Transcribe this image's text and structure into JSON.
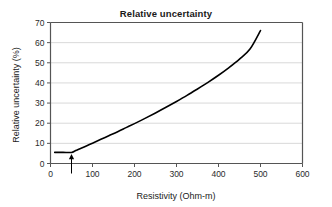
{
  "chart_data": {
    "type": "line",
    "title": "Relative uncertainty",
    "xlabel": "Resistivity (Ohm-m)",
    "ylabel": "Relative uncertainty (%)",
    "xlim": [
      0,
      600
    ],
    "ylim": [
      0,
      70
    ],
    "xticks": [
      0,
      100,
      200,
      300,
      400,
      500,
      600
    ],
    "xtick_labels": [
      "0",
      "100",
      "200",
      "300",
      "400",
      "500",
      "600"
    ],
    "yticks": [
      0,
      10,
      20,
      30,
      40,
      50,
      60,
      70
    ],
    "ytick_labels": [
      "0",
      "10",
      "20",
      "30",
      "40",
      "50",
      "60",
      "70"
    ],
    "grid": "horizontal",
    "grid_color": "#d9d9d9",
    "legend": "none",
    "line_color": "#000000",
    "line_width": 1.6,
    "series": [
      {
        "name": "Relative uncertainty",
        "x": [
          10,
          30,
          50,
          60,
          80,
          100,
          120,
          140,
          160,
          180,
          200,
          225,
          250,
          275,
          300,
          325,
          350,
          375,
          400,
          425,
          450,
          475,
          500
        ],
        "values": [
          5.5,
          5.5,
          5.5,
          6.4,
          8.2,
          10.1,
          12.0,
          13.9,
          15.8,
          17.8,
          19.8,
          22.4,
          25.1,
          27.9,
          30.8,
          33.8,
          37.0,
          40.3,
          43.8,
          47.6,
          51.8,
          56.8,
          66.0
        ]
      }
    ],
    "annotations": [
      {
        "name": "arrow-marker",
        "type": "arrow-up",
        "x": 50,
        "y_from": 0,
        "y_to": 4.2,
        "color": "#000000"
      }
    ]
  }
}
